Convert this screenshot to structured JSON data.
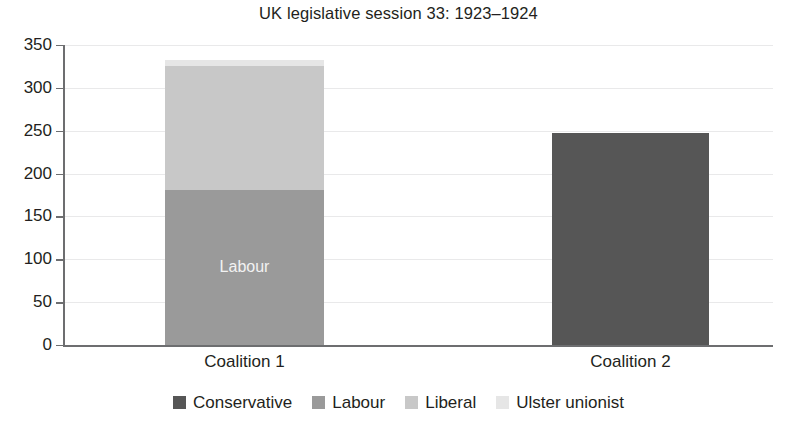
{
  "chart_data": {
    "type": "bar",
    "subtype": "stacked-bar",
    "title": "UK legislative session 33: 1923–1924",
    "subtitle": "",
    "xlabel": "",
    "ylabel": "",
    "categories": [
      "Coalition 1",
      "Coalition 2"
    ],
    "series": [
      {
        "name": "Conservative",
        "color": "#565656",
        "values": [
          0,
          247
        ]
      },
      {
        "name": "Labour",
        "color": "#9a9a9a",
        "values": [
          181,
          0
        ]
      },
      {
        "name": "Liberal",
        "color": "#c8c8c8",
        "values": [
          144,
          0
        ]
      },
      {
        "name": "Ulster unionist",
        "color": "#e6e6e6",
        "values": [
          8,
          0
        ]
      }
    ],
    "totals": [
      333,
      247
    ],
    "ylim": [
      0,
      350
    ],
    "yticks": [
      0,
      50,
      100,
      150,
      200,
      250,
      300,
      350
    ],
    "ytick_labels": [
      "0",
      "50",
      "100",
      "150",
      "200",
      "250",
      "300",
      "350"
    ],
    "grid": true,
    "grid_axis": "y",
    "legend_position": "bottom",
    "bar_annotations": [
      {
        "category": "Coalition 1",
        "series": "Labour",
        "text": "Labour"
      }
    ]
  },
  "legend": {
    "entries": [
      {
        "label": "Conservative",
        "color": "#565656"
      },
      {
        "label": "Labour",
        "color": "#9a9a9a"
      },
      {
        "label": "Liberal",
        "color": "#c8c8c8"
      },
      {
        "label": "Ulster unionist",
        "color": "#e6e6e6"
      }
    ]
  },
  "axis": {
    "axis_color": "#6d6e70",
    "grid_color": "#e9e9ea",
    "text_color": "#231f20"
  }
}
